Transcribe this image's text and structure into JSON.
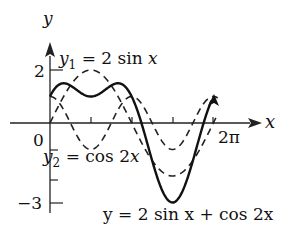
{
  "chart_data": {
    "type": "line",
    "title": "",
    "xlabel": "x",
    "ylabel": "y",
    "xlim": [
      0,
      6.2832
    ],
    "ylim": [
      -3,
      2
    ],
    "grid": false,
    "x_ticks": [
      {
        "value": 0,
        "label": "0"
      },
      {
        "value": 1.5708,
        "label": ""
      },
      {
        "value": 3.1416,
        "label": ""
      },
      {
        "value": 4.7124,
        "label": ""
      },
      {
        "value": 6.2832,
        "label": "2π"
      }
    ],
    "y_ticks": [
      {
        "value": 2,
        "label": "2"
      },
      {
        "value": -3,
        "label": "−3"
      }
    ],
    "series": [
      {
        "name": "y1 = 2 sin x",
        "style": "dashed",
        "expression": "2*sin(x)",
        "x": [
          0,
          0.785,
          1.571,
          2.356,
          3.142,
          3.927,
          4.712,
          5.498,
          6.283
        ],
        "values": [
          0,
          1.41,
          2,
          1.41,
          0,
          -1.41,
          -2,
          -1.41,
          0
        ]
      },
      {
        "name": "y2 = cos 2x",
        "style": "dashed",
        "expression": "cos(2*x)",
        "x": [
          0,
          0.785,
          1.571,
          2.356,
          3.142,
          3.927,
          4.712,
          5.498,
          6.283
        ],
        "values": [
          1,
          0,
          -1,
          0,
          1,
          0,
          -1,
          0,
          1
        ]
      },
      {
        "name": "y = 2 sin x + cos 2x",
        "style": "solid",
        "expression": "2*sin(x)+cos(2*x)",
        "x": [
          0,
          0.785,
          1.571,
          2.356,
          3.142,
          3.927,
          4.712,
          5.498,
          6.283
        ],
        "values": [
          1,
          1.41,
          1,
          1.41,
          1,
          -1.41,
          -3,
          -1.41,
          1
        ]
      }
    ],
    "annotations": [
      {
        "text": "y₁ = 2 sin x",
        "target": "y1 = 2 sin x"
      },
      {
        "text": "y₂ = cos 2x",
        "target": "y2 = cos 2x"
      },
      {
        "text": "y = 2 sin x + cos 2x",
        "target": "y = 2 sin x + cos 2x"
      }
    ]
  },
  "labels": {
    "y_axis": "y",
    "x_axis": "x",
    "tick_2": "2",
    "tick_0": "0",
    "tick_neg3": "−3",
    "tick_2pi": "2π",
    "y1_label": {
      "var": "y",
      "sub": "1",
      "rest": " = 2 sin ",
      "x": "x"
    },
    "y2_label": {
      "var": "y",
      "sub": "2",
      "rest": " = cos 2",
      "x": "x"
    },
    "sum_label": "y = 2 sin x + cos 2x"
  }
}
